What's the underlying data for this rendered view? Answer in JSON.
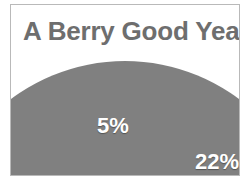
{
  "frame": {
    "border_color": "#b9b9b9",
    "background": "#ffffff"
  },
  "title": {
    "text": "A Berry Good Year",
    "color": "#6e6e6e",
    "caret_visible": true
  },
  "chart_data": {
    "type": "pie",
    "title": "A Berry Good Year",
    "xlabel": "",
    "ylabel": "",
    "legend": "none",
    "grid": false,
    "categories": [
      "Slice 1",
      "Slice 2",
      "Slice 3"
    ],
    "values": [
      73,
      5,
      22
    ],
    "labels": [
      "",
      "5%",
      "22%"
    ],
    "visible_labels": [
      "5%",
      "22%"
    ],
    "colors": [
      "#808080",
      "#6b6b6b",
      "#949494"
    ],
    "label_color": "#ffffff",
    "note": "Pie is clipped by the frame; only the upper cap of the circle is visible."
  },
  "slices": {
    "left": {
      "color": "#808080",
      "percent_text": ""
    },
    "middle": {
      "color": "#6b6b6b",
      "percent_text": "5%"
    },
    "right": {
      "color": "#949494",
      "percent_text": "22%"
    }
  }
}
